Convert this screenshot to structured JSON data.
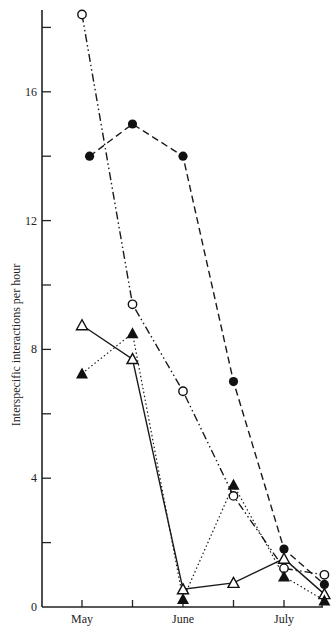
{
  "chart_data": {
    "type": "line",
    "title": "",
    "xlabel": "",
    "ylabel": "Interspecific interactions per hour",
    "ylim": [
      0,
      18.8
    ],
    "grid": false,
    "legend": "none",
    "x_ticks": [
      {
        "pos": 0,
        "label": "May"
      },
      {
        "pos": 1,
        "label": ""
      },
      {
        "pos": 2,
        "label": "June"
      },
      {
        "pos": 3,
        "label": ""
      },
      {
        "pos": 4,
        "label": "July"
      }
    ],
    "y_ticks": [
      {
        "value": 0,
        "label": "0"
      },
      {
        "value": 2,
        "label": ""
      },
      {
        "value": 4,
        "label": "4"
      },
      {
        "value": 6,
        "label": ""
      },
      {
        "value": 8,
        "label": "8"
      },
      {
        "value": 10,
        "label": ""
      },
      {
        "value": 12,
        "label": "12"
      },
      {
        "value": 14,
        "label": ""
      },
      {
        "value": 16,
        "label": "16"
      },
      {
        "value": 18,
        "label": ""
      }
    ],
    "series": [
      {
        "name": "open-circle",
        "marker": "open-circle",
        "line": "dash-dot-dot",
        "x": [
          0,
          1,
          2,
          3,
          4,
          4.8
        ],
        "values": [
          18.4,
          9.4,
          6.7,
          3.45,
          1.2,
          1.0
        ]
      },
      {
        "name": "filled-circle",
        "marker": "filled-circle",
        "line": "dashed",
        "x": [
          0.15,
          1,
          2,
          3,
          4,
          4.8
        ],
        "values": [
          14.0,
          15.0,
          14.0,
          7.0,
          1.8,
          0.7
        ]
      },
      {
        "name": "open-triangle",
        "marker": "open-triangle",
        "line": "solid",
        "x": [
          0,
          1,
          2,
          3,
          4,
          4.8
        ],
        "values": [
          8.75,
          7.7,
          0.55,
          0.75,
          1.5,
          0.4
        ]
      },
      {
        "name": "filled-triangle",
        "marker": "filled-triangle",
        "line": "dotted",
        "x": [
          0,
          1,
          2,
          3,
          4,
          4.8
        ],
        "values": [
          7.25,
          8.5,
          0.25,
          3.8,
          0.95,
          0.2
        ]
      }
    ]
  }
}
